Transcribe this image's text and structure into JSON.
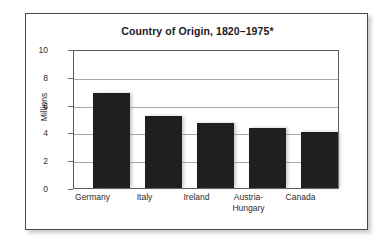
{
  "chart_data": {
    "type": "bar",
    "title": "Country of Origin, 1820–1975*",
    "xlabel": "",
    "ylabel": "Millions",
    "categories": [
      "Germany",
      "Italy",
      "Ireland",
      "Austria-\nHungary",
      "Canada"
    ],
    "values": [
      6.95,
      5.25,
      4.75,
      4.4,
      4.1
    ],
    "ylim": [
      0,
      10
    ],
    "yticks": [
      0,
      2,
      4,
      6,
      8,
      10
    ],
    "ytick_labels": [
      "0",
      "2",
      "4",
      "6",
      "8",
      "10"
    ],
    "grid": true,
    "grid_axis": "y",
    "legend": false,
    "bar_color": "#1f1f1f",
    "background_color": "#ffffff",
    "frame_color": "#4a4a4a",
    "gridline_color": "#a8a8a8",
    "footnote_marker": "*"
  }
}
